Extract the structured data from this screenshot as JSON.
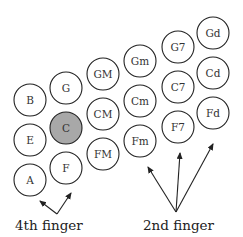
{
  "diagram": {
    "type": "accordion-bass-button-layout",
    "buttons": [
      {
        "label": "B",
        "x": 30,
        "y": 100,
        "highlight": false
      },
      {
        "label": "E",
        "x": 30,
        "y": 140,
        "highlight": false
      },
      {
        "label": "A",
        "x": 30,
        "y": 180,
        "highlight": false
      },
      {
        "label": "G",
        "x": 66,
        "y": 88,
        "highlight": false
      },
      {
        "label": "C",
        "x": 66,
        "y": 128,
        "highlight": true
      },
      {
        "label": "F",
        "x": 66,
        "y": 168,
        "highlight": false
      },
      {
        "label": "GM",
        "x": 103,
        "y": 74,
        "highlight": false
      },
      {
        "label": "CM",
        "x": 103,
        "y": 114,
        "highlight": false
      },
      {
        "label": "FM",
        "x": 103,
        "y": 154,
        "highlight": false
      },
      {
        "label": "Gm",
        "x": 140,
        "y": 61,
        "highlight": false
      },
      {
        "label": "Cm",
        "x": 140,
        "y": 101,
        "highlight": false
      },
      {
        "label": "Fm",
        "x": 140,
        "y": 141,
        "highlight": false
      },
      {
        "label": "G7",
        "x": 178,
        "y": 47,
        "highlight": false
      },
      {
        "label": "C7",
        "x": 178,
        "y": 87,
        "highlight": false
      },
      {
        "label": "F7",
        "x": 178,
        "y": 127,
        "highlight": false
      },
      {
        "label": "Gd",
        "x": 213,
        "y": 33,
        "highlight": false
      },
      {
        "label": "Cd",
        "x": 213,
        "y": 73,
        "highlight": false
      },
      {
        "label": "Fd",
        "x": 213,
        "y": 113,
        "highlight": false
      }
    ],
    "radius": 16,
    "highlight_color": "#a8a8a8",
    "labels": {
      "fourth_finger": "4th finger",
      "second_finger": "2nd finger"
    },
    "arrows": {
      "fourth_finger": {
        "from": [
          57,
          214
        ],
        "to": [
          [
            40,
            201
          ],
          [
            71,
            193
          ]
        ]
      },
      "second_finger": {
        "from": [
          176,
          212
        ],
        "to": [
          [
            148,
            167
          ],
          [
            180,
            153
          ],
          [
            213,
            144
          ]
        ]
      }
    }
  }
}
